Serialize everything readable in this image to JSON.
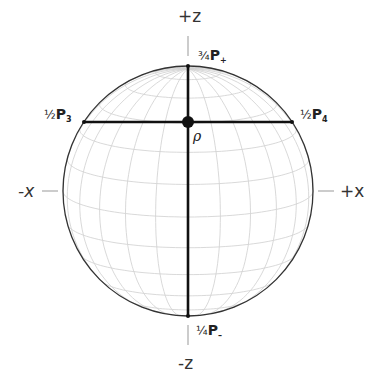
{
  "diagram": {
    "title": "",
    "sphere": {
      "cx": 188,
      "cy": 191,
      "r": 125,
      "tilt_deg": 12,
      "meridian_step_deg": 15,
      "parallel_step_deg": 15,
      "outline_color": "#333333",
      "grid_color": "#cfcfcf"
    },
    "axes": {
      "plus_z": {
        "label": "+z",
        "x": 178,
        "y": 8
      },
      "minus_z": {
        "label": "-z",
        "x": 178,
        "y": 355
      },
      "minus_x": {
        "label": "-x",
        "x": 18,
        "y": 183
      },
      "plus_x": {
        "label": "+x",
        "x": 340,
        "y": 183
      }
    },
    "lines": {
      "vertical": {
        "x": 188,
        "y1": 66,
        "y2": 316,
        "color": "#111111"
      },
      "horizontal": {
        "y": 122,
        "x1": 84,
        "x2": 292,
        "color": "#111111"
      }
    },
    "point_rho": {
      "label": "ρ",
      "x": 188,
      "y": 122,
      "r": 6
    },
    "points": [
      {
        "id": "top",
        "fraction": "¾",
        "symbol": "P",
        "subscript": "+",
        "x": 198,
        "y": 48
      },
      {
        "id": "left",
        "fraction": "½",
        "symbol": "P",
        "subscript": "3",
        "x": 44,
        "y": 107
      },
      {
        "id": "right",
        "fraction": "½",
        "symbol": "P",
        "subscript": "4",
        "x": 300,
        "y": 107
      },
      {
        "id": "bottom",
        "fraction": "¼",
        "symbol": "P",
        "subscript": "–",
        "x": 196,
        "y": 323
      }
    ],
    "rho_label_pos": {
      "x": 193,
      "y": 129
    }
  }
}
